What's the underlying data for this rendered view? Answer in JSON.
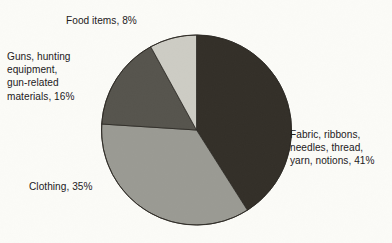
{
  "chart_data": {
    "type": "pie",
    "title": "",
    "subtitle": "",
    "xlabel": "",
    "ylabel": "",
    "legend_position": "none",
    "grid": false,
    "labels_outside": true,
    "start_angle_deg": 0,
    "direction": "clockwise",
    "categories": [
      "Fabric, ribbons, needles, thread, yarn, notions",
      "Clothing",
      "Guns, hunting equipment, gun-related materials",
      "Food items"
    ],
    "values": [
      41,
      35,
      16,
      8
    ],
    "units": "percent",
    "slices": [
      {
        "name": "fabric",
        "label": "Fabric, ribbons,\nneedles, thread,\nyarn, notions, 41%",
        "category": "Fabric, ribbons, needles, thread, yarn, notions",
        "value": 41,
        "percent_text": "41%",
        "color": "#332f28",
        "start_deg": 0,
        "end_deg": 147.6
      },
      {
        "name": "clothing",
        "label": "Clothing, 35%",
        "category": "Clothing",
        "value": 35,
        "percent_text": "35%",
        "color": "#9a9a93",
        "start_deg": 147.6,
        "end_deg": 273.6
      },
      {
        "name": "guns",
        "label": "Guns, hunting\nequipment,\ngun-related\nmaterials, 16%",
        "category": "Guns, hunting equipment, gun-related materials",
        "value": 16,
        "percent_text": "16%",
        "color": "#56544d",
        "start_deg": 273.6,
        "end_deg": 331.2
      },
      {
        "name": "food",
        "label": "Food items, 8%",
        "category": "Food items",
        "value": 8,
        "percent_text": "8%",
        "color": "#cdccc4",
        "start_deg": 331.2,
        "end_deg": 360
      }
    ],
    "colors": {
      "background": "#fbfbf7",
      "text": "#23201c",
      "outline": "#2b2823"
    }
  }
}
